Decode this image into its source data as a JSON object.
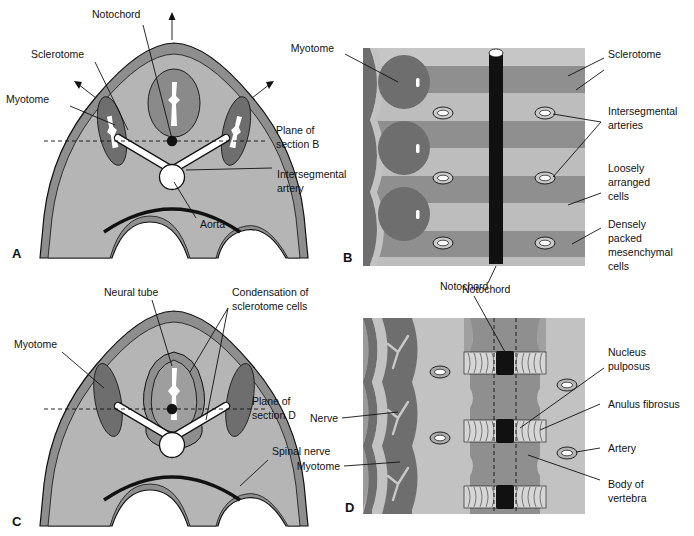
{
  "figure": {
    "panels": [
      "A",
      "B",
      "C",
      "D"
    ],
    "caption": ""
  },
  "colors": {
    "background": "#ffffff",
    "body_light": "#b5b5b5",
    "body_mid": "#9a9a9a",
    "ectoderm": "#8e8e8e",
    "myotome_dark": "#6e6e6e",
    "neural_tube": "#8a8a8a",
    "notochord_black": "#111111",
    "stripe_light": "#bdbdbd",
    "stripe_dark": "#8f8f8f",
    "vessel_white": "#ffffff",
    "outline": "#111111"
  },
  "panel_a": {
    "letter": "A",
    "labels": [
      {
        "id": "notochord",
        "text": "Notochord"
      },
      {
        "id": "sclerotome",
        "text": "Sclerotome"
      },
      {
        "id": "myotome",
        "text": "Myotome"
      },
      {
        "id": "plane-of-section-b",
        "text": "Plane of",
        "text2": "section B"
      },
      {
        "id": "intersegmental-artery",
        "text": "Intersegmental",
        "text2": "artery"
      },
      {
        "id": "aorta",
        "text": "Aorta"
      }
    ]
  },
  "panel_b": {
    "letter": "B",
    "labels": [
      {
        "id": "myotome",
        "text": "Myotome"
      },
      {
        "id": "sclerotome",
        "text": "Sclerotome"
      },
      {
        "id": "intersegmental-arteries",
        "text": "Intersegmental",
        "text2": "arteries"
      },
      {
        "id": "loosely-arranged-cells",
        "text": "Loosely",
        "text2": "arranged",
        "text3": "cells"
      },
      {
        "id": "densely-packed-mesenchymal-cells",
        "text": "Densely",
        "text2": "packed",
        "text3": "mesenchymal",
        "text4": "cells"
      },
      {
        "id": "notochord",
        "text": "Notochord"
      }
    ]
  },
  "panel_c": {
    "letter": "C",
    "labels": [
      {
        "id": "neural-tube",
        "text": "Neural tube"
      },
      {
        "id": "condensation-of-sclerotome-cells",
        "text": "Condensation of",
        "text2": "sclerotome cells"
      },
      {
        "id": "myotome",
        "text": "Myotome"
      },
      {
        "id": "plane-of-section-d",
        "text": "Plane of",
        "text2": "section D"
      },
      {
        "id": "spinal-nerve",
        "text": "Spinal nerve"
      }
    ]
  },
  "panel_d": {
    "letter": "D",
    "labels": [
      {
        "id": "notochord",
        "text": "Notochord"
      },
      {
        "id": "nerve",
        "text": "Nerve"
      },
      {
        "id": "myotome",
        "text": "Myotome"
      },
      {
        "id": "nucleus-pulposus",
        "text": "Nucleus",
        "text2": "pulposus"
      },
      {
        "id": "anulus-fibrosus",
        "text": "Anulus fibrosus"
      },
      {
        "id": "artery",
        "text": "Artery"
      },
      {
        "id": "body-of-vertebra",
        "text": "Body of",
        "text2": "vertebra"
      }
    ]
  }
}
